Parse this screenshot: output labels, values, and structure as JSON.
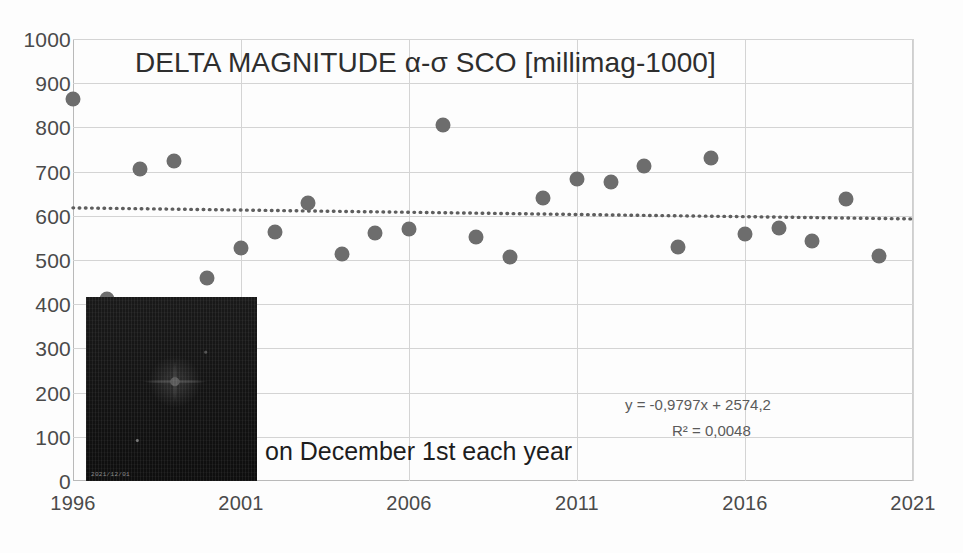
{
  "chart_data": {
    "type": "scatter",
    "title": "DELTA MAGNITUDE α-σ SCO [millimag-1000]",
    "caption": "on December 1st each year",
    "xlabel": "",
    "ylabel": "",
    "xlim": [
      1996,
      2021
    ],
    "ylim": [
      0,
      1000
    ],
    "grid": true,
    "legend": "none",
    "y_ticks": [
      "0",
      "100",
      "200",
      "300",
      "400",
      "500",
      "600",
      "700",
      "800",
      "900",
      "1000"
    ],
    "y_tick_values": [
      0,
      100,
      200,
      300,
      400,
      500,
      600,
      700,
      800,
      900,
      1000
    ],
    "x_ticks": [
      "1996",
      "2001",
      "2006",
      "2011",
      "2016",
      "2021"
    ],
    "x_tick_values": [
      1996,
      2001,
      2006,
      2011,
      2016,
      2021
    ],
    "marker_color": "#6d6d6d",
    "trendline": {
      "style": "dotted",
      "color": "#5e5e5e",
      "equation": "y = -0,9797x + 2574,2",
      "r_squared": "R² = 0,0048",
      "slope": -0.9797,
      "intercept": 2574.2,
      "x_start": 1996,
      "y_start": 618,
      "x_end": 2021,
      "y_end": 593
    },
    "x": [
      1996,
      1997,
      1998,
      1999,
      2000,
      2001,
      2002,
      2003,
      2004,
      2005,
      2006,
      2007,
      2008,
      2009,
      2010,
      2011,
      2012,
      2013,
      2014,
      2015,
      2016,
      2017,
      2018,
      2019,
      2020
    ],
    "values": [
      865,
      411,
      705,
      723,
      460,
      527,
      563,
      628,
      514,
      560,
      570,
      806,
      553,
      506,
      641,
      683,
      676,
      713,
      530,
      730,
      559,
      573,
      544,
      638,
      510
    ],
    "points": [
      {
        "x": 1996,
        "y": 865
      },
      {
        "x": 1997,
        "y": 411
      },
      {
        "x": 1998,
        "y": 705
      },
      {
        "x": 1999,
        "y": 723
      },
      {
        "x": 2000,
        "y": 460
      },
      {
        "x": 2001,
        "y": 527
      },
      {
        "x": 2002,
        "y": 563
      },
      {
        "x": 2003,
        "y": 628
      },
      {
        "x": 2004,
        "y": 514
      },
      {
        "x": 2005,
        "y": 560
      },
      {
        "x": 2006,
        "y": 570
      },
      {
        "x": 2007,
        "y": 806
      },
      {
        "x": 2008,
        "y": 553
      },
      {
        "x": 2009,
        "y": 506
      },
      {
        "x": 2010,
        "y": 641
      },
      {
        "x": 2011,
        "y": 683
      },
      {
        "x": 2012,
        "y": 676
      },
      {
        "x": 2013,
        "y": 713
      },
      {
        "x": 2014,
        "y": 530
      },
      {
        "x": 2015,
        "y": 730
      },
      {
        "x": 2016,
        "y": 559
      },
      {
        "x": 2017,
        "y": 573
      },
      {
        "x": 2018,
        "y": 544
      },
      {
        "x": 2019,
        "y": 638
      },
      {
        "x": 2020,
        "y": 510
      }
    ]
  },
  "photo": {
    "timestamp_stamp": "2021/12/01"
  }
}
